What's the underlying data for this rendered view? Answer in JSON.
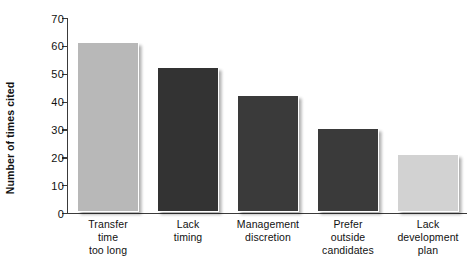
{
  "chart_data": {
    "type": "bar",
    "title": "",
    "subtitle": "",
    "xlabel": "",
    "ylabel": "Number of times cited",
    "ylim": [
      0,
      70
    ],
    "ytick_interval": 10,
    "yticks": [
      70,
      60,
      50,
      40,
      30,
      20,
      10,
      0
    ],
    "grid": false,
    "legend": null,
    "categories": [
      "Transfer time too long",
      "Lack timing",
      "Management discretion",
      "Prefer outside candidates",
      "Lack development plan"
    ],
    "category_lines": [
      [
        "Transfer",
        "time",
        "too long"
      ],
      [
        "Lack",
        "timing"
      ],
      [
        "Management",
        "discretion"
      ],
      [
        "Prefer",
        "outside",
        "candidates"
      ],
      [
        "Lack",
        "development",
        "plan"
      ]
    ],
    "values": [
      61,
      52,
      42,
      30,
      21
    ],
    "bar_colors": [
      "#b8b8b8",
      "#333333",
      "#3a3a3a",
      "#3a3a3a",
      "#d2d2d2"
    ],
    "bar_border_color": "#ffffff",
    "axis_color": "#3a3a3a",
    "text_color": "#111111",
    "background_color": "#ffffff"
  }
}
